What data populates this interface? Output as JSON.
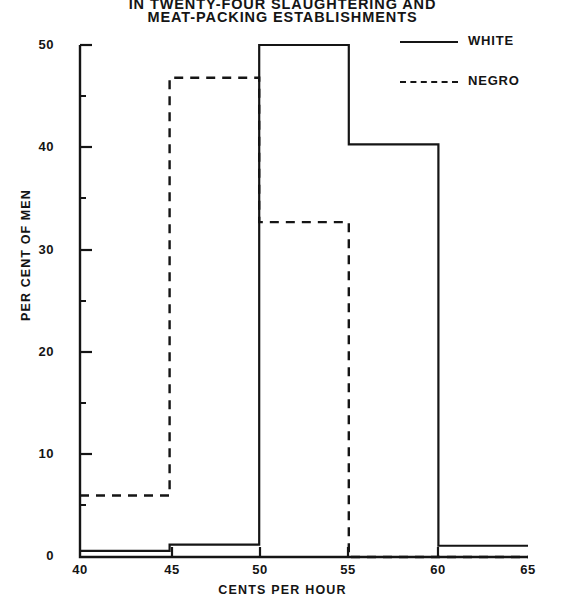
{
  "chart_data": {
    "type": "bar",
    "title": "IN TWENTY-FOUR SLAUGHTERING AND MEAT-PACKING ESTABLISHMENTS",
    "title_line1": "IN TWENTY-FOUR SLAUGHTERING AND",
    "title_line2": "MEAT-PACKING ESTABLISHMENTS",
    "xlabel": "CENTS PER HOUR",
    "ylabel": "PER CENT OF MEN",
    "xlim": [
      40,
      65
    ],
    "ylim": [
      0,
      50
    ],
    "grid": false,
    "legend_position": "top-right",
    "bin_edges": [
      40,
      45,
      50,
      55,
      60,
      65
    ],
    "categories": [
      "40-45",
      "45-50",
      "50-55",
      "55-60",
      "60-65"
    ],
    "xticks": [
      "40",
      "45",
      "50",
      "55",
      "60",
      "65"
    ],
    "yticks": [
      "0",
      "10",
      "20",
      "30",
      "40",
      "50"
    ],
    "series": [
      {
        "name": "WHITE",
        "style": "solid",
        "values": [
          0.6,
          1.2,
          50.0,
          40.3,
          1.1
        ]
      },
      {
        "name": "NEGRO",
        "style": "dashed",
        "values": [
          6.0,
          46.8,
          32.7,
          0.0,
          0.0
        ]
      }
    ]
  },
  "legend": {
    "items": [
      {
        "label": "WHITE"
      },
      {
        "label": "NEGRO"
      }
    ]
  },
  "colors": {
    "ink": "#151515",
    "background": "#ffffff"
  }
}
